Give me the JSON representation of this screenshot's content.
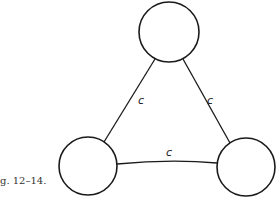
{
  "caption": "g. 12–14.",
  "diagram": {
    "nodes": [
      {
        "id": "top",
        "label": ""
      },
      {
        "id": "bottom-left",
        "label": ""
      },
      {
        "id": "bottom-right",
        "label": ""
      }
    ],
    "edges": [
      {
        "from": "top",
        "to": "bottom-left",
        "label": "c"
      },
      {
        "from": "top",
        "to": "bottom-right",
        "label": "c"
      },
      {
        "from": "bottom-left",
        "to": "bottom-right",
        "label": "c"
      }
    ]
  }
}
